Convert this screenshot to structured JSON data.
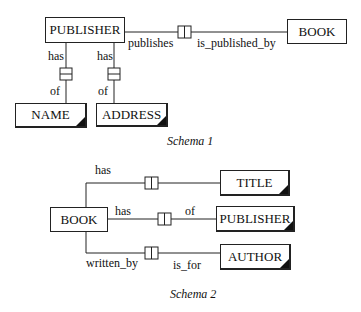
{
  "schema1": {
    "caption": "Schema 1",
    "entities": {
      "publisher": "PUBLISHER",
      "book": "BOOK",
      "name": "NAME",
      "address": "ADDRESS"
    },
    "roles": {
      "publishes": "publishes",
      "is_published_by": "is_published_by",
      "name_has": "has",
      "name_of": "of",
      "address_has": "has",
      "address_of": "of"
    }
  },
  "schema2": {
    "caption": "Schema 2",
    "entities": {
      "book": "BOOK",
      "title": "TITLE",
      "publisher": "PUBLISHER",
      "author": "AUTHOR"
    },
    "roles": {
      "title_has": "has",
      "publisher_has": "has",
      "publisher_of": "of",
      "written_by": "written_by",
      "is_for": "is_for"
    }
  }
}
